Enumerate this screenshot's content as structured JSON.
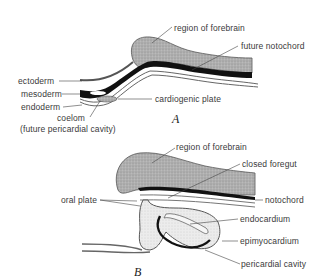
{
  "figure_a": {
    "caption": "A",
    "labels": {
      "region_of_forebrain": "region of forebrain",
      "future_notochord": "future notochord",
      "ectoderm": "ectoderm",
      "mesoderm": "mesoderm",
      "endoderm": "endoderm",
      "cardiogenic_plate": "cardiogenic plate",
      "coelom": "coelom",
      "coelom_note": "(future pericardial cavity)"
    }
  },
  "figure_b": {
    "caption": "B",
    "labels": {
      "region_of_forebrain": "region of forebrain",
      "closed_foregut": "closed foregut",
      "oral_plate": "oral plate",
      "notochord": "notochord",
      "endocardium": "endocardium",
      "epimyocardium": "epimyocardium",
      "pericardial_cavity": "pericardial cavity"
    }
  },
  "colors": {
    "neural_tissue": "#a9a9a9",
    "mesoderm": "#111111",
    "outline": "#333333",
    "label_text": "#3a3a3a"
  }
}
